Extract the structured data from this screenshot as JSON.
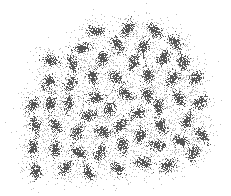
{
  "chart_data": {
    "type": "scatter",
    "title": "",
    "xlabel": "",
    "ylabel": "",
    "grid": false,
    "axes_visible": false,
    "legend": null,
    "xlim": [
      0,
      231
    ],
    "ylim": [
      0,
      196
    ],
    "point_color": "#555555",
    "halo_color": "#bdbdbd",
    "cluster_spread": 3.2,
    "halo_spread": 8,
    "points_per_cluster": 140,
    "halo_points_per_cluster": 90,
    "clusters": [
      {
        "x": 95,
        "y": 30
      },
      {
        "x": 127,
        "y": 28
      },
      {
        "x": 154,
        "y": 30
      },
      {
        "x": 82,
        "y": 47
      },
      {
        "x": 117,
        "y": 45
      },
      {
        "x": 143,
        "y": 47
      },
      {
        "x": 175,
        "y": 42
      },
      {
        "x": 50,
        "y": 60
      },
      {
        "x": 72,
        "y": 63
      },
      {
        "x": 102,
        "y": 58
      },
      {
        "x": 133,
        "y": 62
      },
      {
        "x": 163,
        "y": 58
      },
      {
        "x": 183,
        "y": 62
      },
      {
        "x": 48,
        "y": 82
      },
      {
        "x": 70,
        "y": 83
      },
      {
        "x": 92,
        "y": 77
      },
      {
        "x": 115,
        "y": 77
      },
      {
        "x": 148,
        "y": 75
      },
      {
        "x": 172,
        "y": 78
      },
      {
        "x": 195,
        "y": 78
      },
      {
        "x": 32,
        "y": 105
      },
      {
        "x": 50,
        "y": 103
      },
      {
        "x": 68,
        "y": 103
      },
      {
        "x": 95,
        "y": 97
      },
      {
        "x": 125,
        "y": 93
      },
      {
        "x": 147,
        "y": 95
      },
      {
        "x": 178,
        "y": 98
      },
      {
        "x": 200,
        "y": 102
      },
      {
        "x": 35,
        "y": 125
      },
      {
        "x": 55,
        "y": 125
      },
      {
        "x": 88,
        "y": 115
      },
      {
        "x": 110,
        "y": 108
      },
      {
        "x": 137,
        "y": 113
      },
      {
        "x": 158,
        "y": 107
      },
      {
        "x": 187,
        "y": 120
      },
      {
        "x": 77,
        "y": 132
      },
      {
        "x": 102,
        "y": 132
      },
      {
        "x": 120,
        "y": 125
      },
      {
        "x": 160,
        "y": 125
      },
      {
        "x": 140,
        "y": 135
      },
      {
        "x": 202,
        "y": 135
      },
      {
        "x": 180,
        "y": 140
      },
      {
        "x": 33,
        "y": 147
      },
      {
        "x": 55,
        "y": 148
      },
      {
        "x": 78,
        "y": 152
      },
      {
        "x": 100,
        "y": 152
      },
      {
        "x": 122,
        "y": 145
      },
      {
        "x": 157,
        "y": 145
      },
      {
        "x": 193,
        "y": 153
      },
      {
        "x": 35,
        "y": 170
      },
      {
        "x": 65,
        "y": 168
      },
      {
        "x": 88,
        "y": 172
      },
      {
        "x": 117,
        "y": 168
      },
      {
        "x": 143,
        "y": 162
      },
      {
        "x": 167,
        "y": 165
      }
    ]
  }
}
